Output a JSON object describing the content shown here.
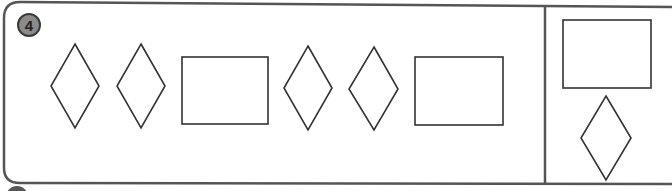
{
  "exercise": {
    "number": "4",
    "sequence": [
      "diamond",
      "diamond",
      "rectangle",
      "diamond",
      "diamond",
      "rectangle"
    ],
    "answer_options": [
      "rectangle",
      "diamond"
    ]
  },
  "colors": {
    "stroke": "#333333",
    "border": "#555555",
    "badge_fill": "#8a8a8a",
    "background": "#ffffff"
  }
}
